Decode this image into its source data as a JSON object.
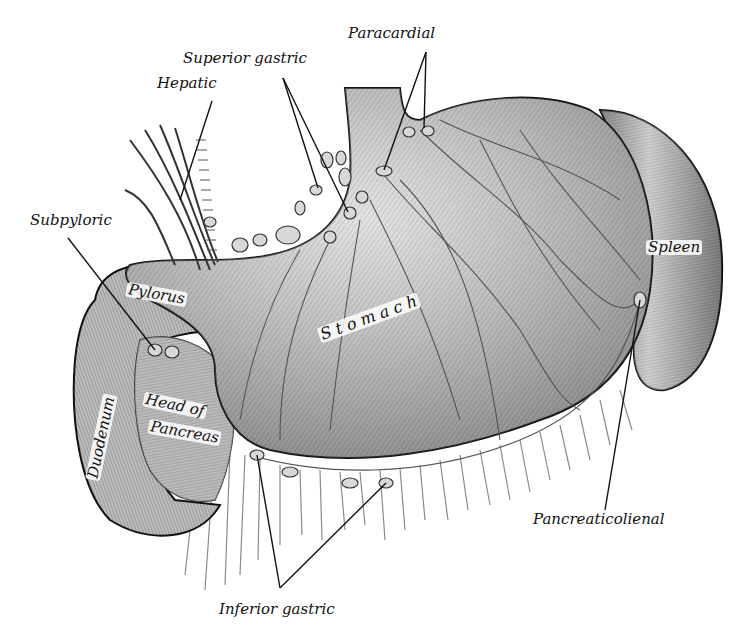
{
  "figure": {
    "colors": {
      "background": "#ffffff",
      "ink": "#111111",
      "organ_fill": "#c9c9c9",
      "organ_shadow": "#7a7a7a",
      "node_fill": "#d8d8d8",
      "vessel": "#555555"
    }
  },
  "labels": {
    "paracardial": "Paracardial",
    "superior_gastric": "Superior gastric",
    "hepatic": "Hepatic",
    "subpyloric": "Subpyloric",
    "pylorus": "Pylorus",
    "stomach": "S t o m a c h",
    "head_of_pancreas_line1": "Head of",
    "head_of_pancreas_line2": "Pancreas",
    "duodenum": "Duodenum",
    "spleen": "Spleen",
    "pancreaticolienal": "Pancreaticolienal",
    "inferior_gastric": "Inferior gastric"
  }
}
